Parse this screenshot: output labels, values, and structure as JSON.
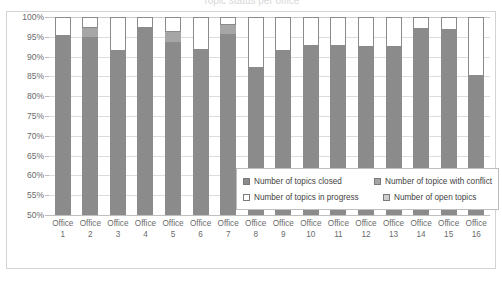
{
  "title": {
    "text": "Topic status per office"
  },
  "legend": {
    "position": "inside-bottom-center",
    "items": [
      {
        "label": "Number of topics closed",
        "swatch": "sw-closed",
        "icon": "legend-swatch-closed"
      },
      {
        "label": "Number of topice with conflict",
        "swatch": "sw-conflict",
        "icon": "legend-swatch-conflict"
      },
      {
        "label": "Number of topics in progress",
        "swatch": "sw-progress",
        "icon": "legend-swatch-progress"
      },
      {
        "label": "Number of open topics",
        "swatch": "sw-open",
        "icon": "legend-swatch-open"
      }
    ]
  },
  "axes": {
    "y_ticks": [
      "100%",
      "95%",
      "90%",
      "85%",
      "80%",
      "75%",
      "70%",
      "65%",
      "60%",
      "55%",
      "50%"
    ],
    "x_labels": [
      {
        "line1": "Office",
        "line2": "1"
      },
      {
        "line1": "Office",
        "line2": "2"
      },
      {
        "line1": "Office",
        "line2": "3"
      },
      {
        "line1": "Office",
        "line2": "4"
      },
      {
        "line1": "Office",
        "line2": "5"
      },
      {
        "line1": "Office",
        "line2": "6"
      },
      {
        "line1": "Office",
        "line2": "7"
      },
      {
        "line1": "Office",
        "line2": "8"
      },
      {
        "line1": "Office",
        "line2": "9"
      },
      {
        "line1": "Office",
        "line2": "10"
      },
      {
        "line1": "Office",
        "line2": "11"
      },
      {
        "line1": "Office",
        "line2": "12"
      },
      {
        "line1": "Office",
        "line2": "13"
      },
      {
        "line1": "Office",
        "line2": "14"
      },
      {
        "line1": "Office",
        "line2": "15"
      },
      {
        "line1": "Office",
        "line2": "16"
      }
    ]
  },
  "colors": {
    "closed": "#8b8b8b",
    "conflict": "#a6a6a6",
    "in_progress": "#ffffff",
    "open": "#cfcfcf",
    "gridline": "#dcdcdc",
    "frame": "#d4d4d4",
    "tick_text": "#6b6b6b"
  },
  "chart_data": {
    "type": "bar",
    "subtype": "100% stacked column",
    "title": "Topic status per office",
    "xlabel": "",
    "ylabel": "",
    "ylim": [
      50,
      100
    ],
    "ytick_step": 5,
    "grid": true,
    "legend_position": "inside-bottom-center",
    "categories": [
      "Office 1",
      "Office 2",
      "Office 3",
      "Office 4",
      "Office 5",
      "Office 6",
      "Office 7",
      "Office 8",
      "Office 9",
      "Office 10",
      "Office 11",
      "Office 12",
      "Office 13",
      "Office 14",
      "Office 15",
      "Office 16"
    ],
    "series": [
      {
        "name": "Number of topics closed",
        "color": "#8b8b8b",
        "values": [
          95.2,
          95.0,
          91.3,
          97.2,
          93.7,
          91.7,
          95.8,
          87.0,
          91.3,
          92.6,
          92.6,
          92.4,
          92.4,
          97.0,
          96.6,
          85.2
        ]
      },
      {
        "name": "Number of topice with conflict",
        "color": "#a6a6a6",
        "values": [
          0.0,
          2.2,
          0.0,
          0.0,
          2.6,
          0.0,
          2.2,
          0.0,
          0.0,
          0.0,
          0.0,
          0.0,
          0.0,
          0.0,
          0.0,
          0.0
        ]
      },
      {
        "name": "Number of topics in progress",
        "color": "#ffffff",
        "values": [
          4.8,
          2.8,
          8.7,
          2.8,
          3.7,
          8.3,
          2.0,
          13.0,
          8.7,
          7.4,
          7.4,
          7.6,
          7.6,
          3.0,
          3.4,
          14.8
        ]
      },
      {
        "name": "Number of open topics",
        "color": "#cfcfcf",
        "values": [
          0.0,
          0.0,
          0.0,
          0.0,
          0.0,
          0.0,
          0.0,
          0.0,
          0.0,
          0.0,
          0.0,
          0.0,
          0.0,
          0.0,
          0.0,
          0.0
        ]
      }
    ]
  }
}
